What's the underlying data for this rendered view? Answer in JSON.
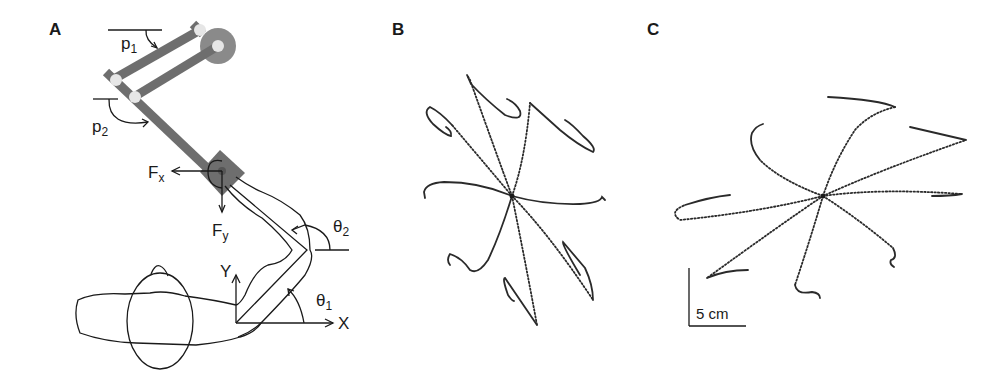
{
  "figure": {
    "panels": [
      {
        "id": "A",
        "label": "A",
        "description": "Schematic of subject holding a two-link planar manipulandum",
        "annotations": {
          "p1": {
            "main": "p",
            "sub": "1"
          },
          "p2": {
            "main": "p",
            "sub": "2"
          },
          "Fx": {
            "main": "F",
            "sub": "x"
          },
          "Fy": {
            "main": "F",
            "sub": "y"
          },
          "theta1": {
            "main": "θ",
            "sub": "1"
          },
          "theta2": {
            "main": "θ",
            "sub": "2"
          },
          "X": "X",
          "Y": "Y"
        }
      },
      {
        "id": "B",
        "label": "B",
        "description": "Center-out hand trajectories to 8 targets (with force field)"
      },
      {
        "id": "C",
        "label": "C",
        "description": "Center-out hand trajectories to 8 targets",
        "scale_bar": "5 cm"
      }
    ]
  },
  "colors": {
    "ink": "#1a1a1a",
    "manipulandum": "#6e6e6e",
    "joint": "#e6e6e6",
    "motor": "#8a8a8a"
  }
}
